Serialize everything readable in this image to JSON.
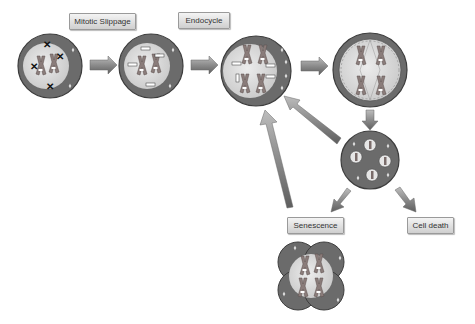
{
  "labels": {
    "mitotic_slippage": "Mitotic Slippage",
    "endocycle": "Endocycle",
    "senescence": "Senescence",
    "cell_death": "Cell death"
  },
  "colors": {
    "cell_outer": "#6e6e6e",
    "cell_inner": "#d8d8d8",
    "chromosome": "#8a7a78",
    "arrow": "#8a8a8a",
    "label_bg": "#e0e0e0"
  },
  "stages": [
    {
      "id": "cell-1",
      "description": "Cell with marked chromosomes and crossed markers"
    },
    {
      "id": "cell-2",
      "description": "Cell after mitotic slippage"
    },
    {
      "id": "cell-3",
      "description": "Endocycling polyploid cell"
    },
    {
      "id": "cell-4",
      "description": "Cell with spindle"
    },
    {
      "id": "cell-5",
      "description": "Multinucleated cell"
    },
    {
      "id": "cell-6",
      "description": "Senescent multi-lobed cell"
    }
  ]
}
